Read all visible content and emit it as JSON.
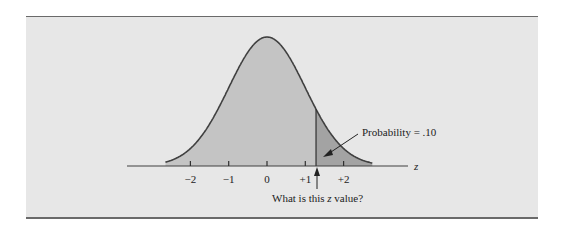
{
  "chart_data": {
    "type": "area",
    "title": "",
    "xlabel": "z",
    "ylabel": "",
    "x_ticks": [
      -2,
      -1,
      0,
      1,
      2
    ],
    "tick_labels": [
      "−2",
      "−1",
      "0",
      "+1",
      "+2"
    ],
    "xlim": [
      -2.65,
      2.8
    ],
    "distribution": {
      "mean": 0,
      "sd": 1
    },
    "shaded_region": {
      "from_z": 1.28,
      "to_z": "inf",
      "probability": 0.1
    },
    "annotations": [
      {
        "text": "Probability = .10",
        "points_to": "upper tail area"
      },
      {
        "text": "What is this z value?",
        "points_to": "cutoff z = 1.28"
      }
    ],
    "grid": false,
    "legend": null
  },
  "labels": {
    "axis_var": "z",
    "ticks": [
      "−2",
      "−1",
      "0",
      "+1",
      "+2"
    ],
    "prob_prefix": "Probability = ",
    "prob_value": ".10",
    "question_prefix": "What is this ",
    "question_var": "z",
    "question_suffix": " value?"
  },
  "colors": {
    "panel": "#e7e7e7",
    "curve_fill": "#c4c4c4",
    "tail_fill": "#a3a3a3",
    "stroke": "#404040"
  }
}
